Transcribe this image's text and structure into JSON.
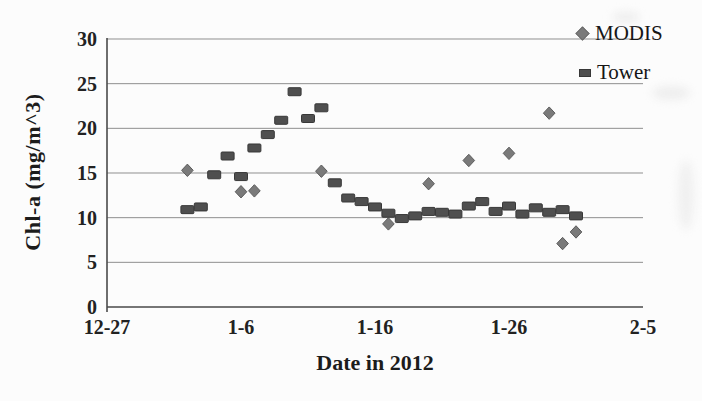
{
  "figure": {
    "background": "#fcfcfc",
    "gridline_color": "#8f8f8f",
    "axis_color": "#4a4a4a",
    "text_color": "#1c1c1c"
  },
  "chart_data": {
    "type": "scatter",
    "title": "",
    "xlabel": "Date in 2012",
    "ylabel": "Chl-a (mg/m^3)",
    "grid": "horizontal-only",
    "legend_position": "top-right",
    "ylim": [
      0,
      30
    ],
    "y_ticks": [
      0,
      5,
      10,
      15,
      20,
      25,
      30
    ],
    "xlim_days": [
      0,
      40
    ],
    "x_ticks": [
      {
        "label": "12-27",
        "day": 0
      },
      {
        "label": "1-6",
        "day": 10
      },
      {
        "label": "1-16",
        "day": 20
      },
      {
        "label": "1-26",
        "day": 30
      },
      {
        "label": "2-5",
        "day": 40
      }
    ],
    "series": [
      {
        "name": "MODIS",
        "marker": "diamond",
        "color": "#7a7a7a",
        "edge_color": "#5c5c5c",
        "points": [
          {
            "date": "1-2",
            "day": 6,
            "value": 15.3
          },
          {
            "date": "1-6",
            "day": 10,
            "value": 12.9
          },
          {
            "date": "1-7",
            "day": 11,
            "value": 13.0
          },
          {
            "date": "1-12",
            "day": 16,
            "value": 15.2
          },
          {
            "date": "1-17",
            "day": 21,
            "value": 9.3
          },
          {
            "date": "1-20",
            "day": 24,
            "value": 13.8
          },
          {
            "date": "1-23",
            "day": 27,
            "value": 16.4
          },
          {
            "date": "1-26",
            "day": 30,
            "value": 17.2
          },
          {
            "date": "1-29",
            "day": 33,
            "value": 21.7
          },
          {
            "date": "1-30",
            "day": 34,
            "value": 7.1
          },
          {
            "date": "1-31",
            "day": 35,
            "value": 8.4
          }
        ]
      },
      {
        "name": "Tower",
        "marker": "square",
        "color": "#4f4f4f",
        "edge_color": "#383838",
        "points": [
          {
            "date": "1-2",
            "day": 6,
            "value": 10.9
          },
          {
            "date": "1-3",
            "day": 7,
            "value": 11.2
          },
          {
            "date": "1-4",
            "day": 8,
            "value": 14.8
          },
          {
            "date": "1-5",
            "day": 9,
            "value": 16.9
          },
          {
            "date": "1-6",
            "day": 10,
            "value": 14.6
          },
          {
            "date": "1-7",
            "day": 11,
            "value": 17.8
          },
          {
            "date": "1-8",
            "day": 12,
            "value": 19.3
          },
          {
            "date": "1-9",
            "day": 13,
            "value": 20.9
          },
          {
            "date": "1-10",
            "day": 14,
            "value": 24.1
          },
          {
            "date": "1-11",
            "day": 15,
            "value": 21.1
          },
          {
            "date": "1-12",
            "day": 16,
            "value": 22.3
          },
          {
            "date": "1-13",
            "day": 17,
            "value": 13.9
          },
          {
            "date": "1-14",
            "day": 18,
            "value": 12.2
          },
          {
            "date": "1-15",
            "day": 19,
            "value": 11.8
          },
          {
            "date": "1-16",
            "day": 20,
            "value": 11.2
          },
          {
            "date": "1-17",
            "day": 21,
            "value": 10.5
          },
          {
            "date": "1-18",
            "day": 22,
            "value": 9.9
          },
          {
            "date": "1-19",
            "day": 23,
            "value": 10.2
          },
          {
            "date": "1-20",
            "day": 24,
            "value": 10.7
          },
          {
            "date": "1-21",
            "day": 25,
            "value": 10.6
          },
          {
            "date": "1-22",
            "day": 26,
            "value": 10.4
          },
          {
            "date": "1-23",
            "day": 27,
            "value": 11.3
          },
          {
            "date": "1-24",
            "day": 28,
            "value": 11.8
          },
          {
            "date": "1-25",
            "day": 29,
            "value": 10.7
          },
          {
            "date": "1-26",
            "day": 30,
            "value": 11.3
          },
          {
            "date": "1-27",
            "day": 31,
            "value": 10.4
          },
          {
            "date": "1-28",
            "day": 32,
            "value": 11.1
          },
          {
            "date": "1-29",
            "day": 33,
            "value": 10.6
          },
          {
            "date": "1-30",
            "day": 34,
            "value": 10.9
          },
          {
            "date": "1-31",
            "day": 35,
            "value": 10.2
          }
        ]
      }
    ]
  }
}
